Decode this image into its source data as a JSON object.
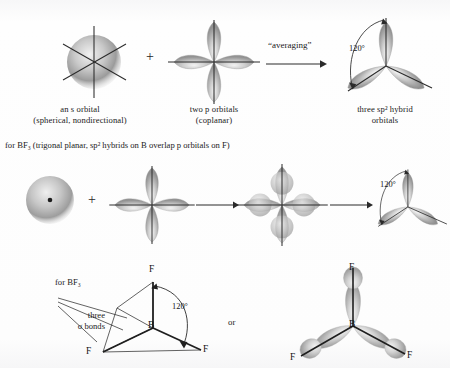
{
  "figure": {
    "background_color": "#fdfdfd",
    "ink_color": "#1a1a1a",
    "orbital_shade": "#8a8a8a"
  },
  "row1": {
    "captions": [
      {
        "line1": "an s orbital",
        "line2": "(spherical, nondirectional)"
      },
      {
        "line1": "two p orbitals",
        "line2": "(coplanar)"
      },
      {
        "line1": "three sp² hybrid",
        "line2": "orbitals"
      }
    ],
    "plus": "+",
    "operation_label": "“averaging”",
    "angle_label": "120°"
  },
  "row2": {
    "heading": "for BF₃ (trigonal planar, sp² hybrids on B overlap p orbitals on F)",
    "plus": "+",
    "angle_label": "120°"
  },
  "row3": {
    "heading": "for BF₃",
    "bond_label_line1": "three",
    "bond_label_line2": "σ bonds",
    "angle_label": "120°",
    "connector": "or",
    "left_structure": {
      "center_atom": "B",
      "ligands": [
        "F",
        "F",
        "F"
      ]
    },
    "right_structure": {
      "center_atom": "B",
      "ligands": [
        "F",
        "F",
        "F"
      ]
    }
  }
}
